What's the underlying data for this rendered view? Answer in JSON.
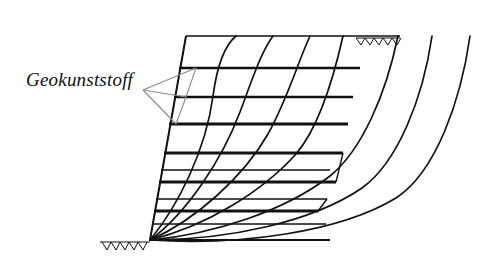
{
  "figure": {
    "kind": "engineering-cross-section",
    "background_color": "#ffffff",
    "line_color": "#111111",
    "leader_color": "#7a7a7a",
    "width": 497,
    "height": 268
  },
  "labels": {
    "geosynthetic": "Geokunststoff"
  },
  "callout": {
    "apex_x": 143,
    "apex_y": 90,
    "targets": [
      {
        "x": 196,
        "y": 68
      },
      {
        "x": 186,
        "y": 97
      },
      {
        "x": 176,
        "y": 124
      }
    ]
  },
  "geometry": {
    "crest_y": 36,
    "crest_x_start": 186,
    "crest_x_end": 400,
    "toe_x": 150,
    "toe_y": 240,
    "base_x_end": 330,
    "slope_face": {
      "x1": 186,
      "y1": 36,
      "x2": 150,
      "y2": 240
    }
  },
  "ground_hatch": {
    "top": {
      "x_start": 356,
      "x_end": 400,
      "y": 38,
      "teeth": 5
    },
    "bottom": {
      "x_start": 100,
      "x_end": 150,
      "y": 242,
      "teeth": 5
    }
  },
  "reinforcement_layers": [
    {
      "index": 1,
      "y": 68,
      "x_left": 179,
      "x_right": 360
    },
    {
      "index": 2,
      "y": 97,
      "x_left": 174,
      "x_right": 353
    },
    {
      "index": 3,
      "y": 124,
      "x_left": 169,
      "x_right": 348
    },
    {
      "index": 4,
      "y": 153,
      "x_left": 164,
      "x_right": 343
    },
    {
      "index": 5,
      "y": 170,
      "x_left": 161,
      "x_right": 330
    },
    {
      "index": 6,
      "y": 182,
      "x_left": 159,
      "x_right": 336
    },
    {
      "index": 7,
      "y": 199,
      "x_left": 156,
      "x_right": 327
    },
    {
      "index": 8,
      "y": 211,
      "x_left": 154,
      "x_right": 318
    },
    {
      "index": 9,
      "y": 224,
      "x_left": 152,
      "x_right": 326
    }
  ],
  "slip_surfaces": [
    {
      "index": 1,
      "exit_x": 236,
      "exit_y": 36,
      "label": "innermost-slip-surface"
    },
    {
      "index": 2,
      "exit_x": 273,
      "exit_y": 36,
      "label": "slip-surface-2"
    },
    {
      "index": 3,
      "exit_x": 310,
      "exit_y": 36,
      "label": "slip-surface-3"
    },
    {
      "index": 4,
      "exit_x": 343,
      "exit_y": 36,
      "label": "slip-surface-4"
    },
    {
      "index": 5,
      "exit_x": 398,
      "exit_y": 36,
      "label": "slip-surface-5"
    },
    {
      "index": 6,
      "exit_x": 432,
      "exit_y": 36,
      "label": "slip-surface-6"
    },
    {
      "index": 7,
      "exit_x": 470,
      "exit_y": 36,
      "label": "outermost-slip-surface"
    }
  ]
}
